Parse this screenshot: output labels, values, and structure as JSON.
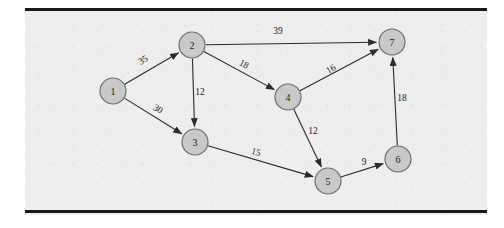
{
  "figure": {
    "background_color": "#eeeeee",
    "rule_color": "#1a1a1a",
    "node_fill": "#c9c9c9",
    "node_stroke": "#6e6e6e",
    "edge_color": "#2b2b2b"
  },
  "chart_data": {
    "type": "diagram",
    "diagram_kind": "directed-weighted-graph",
    "title": "",
    "nodes": [
      {
        "id": "1",
        "label": "1",
        "x": 113,
        "y": 91,
        "r": 13
      },
      {
        "id": "2",
        "label": "2",
        "x": 192,
        "y": 45,
        "r": 13
      },
      {
        "id": "3",
        "label": "3",
        "x": 195,
        "y": 142,
        "r": 13
      },
      {
        "id": "4",
        "label": "4",
        "x": 288,
        "y": 97,
        "r": 13
      },
      {
        "id": "5",
        "label": "5",
        "x": 328,
        "y": 181,
        "r": 13
      },
      {
        "id": "6",
        "label": "6",
        "x": 398,
        "y": 159,
        "r": 13
      },
      {
        "id": "7",
        "label": "7",
        "x": 392,
        "y": 42,
        "r": 13
      }
    ],
    "edges": [
      {
        "from": "1",
        "to": "2",
        "weight": 35,
        "label": "35",
        "label_x": 143,
        "label_y": 60,
        "label_rotate": -30
      },
      {
        "from": "1",
        "to": "3",
        "weight": 30,
        "label": "30",
        "label_x": 158,
        "label_y": 109,
        "label_rotate": 31
      },
      {
        "from": "2",
        "to": "3",
        "weight": 12,
        "label": "12",
        "label_x": 200,
        "label_y": 92,
        "label_rotate": 0
      },
      {
        "from": "2",
        "to": "4",
        "weight": 18,
        "label": "18",
        "label_x": 244,
        "label_y": 64,
        "label_rotate": 28
      },
      {
        "from": "2",
        "to": "7",
        "weight": 39,
        "label": "39",
        "label_x": 278,
        "label_y": 31,
        "label_rotate": 0
      },
      {
        "from": "3",
        "to": "5",
        "weight": 15,
        "label": "15",
        "label_x": 256,
        "label_y": 152,
        "label_rotate": 14
      },
      {
        "from": "4",
        "to": "5",
        "weight": 12,
        "label": "12",
        "label_x": 313,
        "label_y": 131,
        "label_rotate": 0
      },
      {
        "from": "4",
        "to": "7",
        "weight": 16,
        "label": "16",
        "label_x": 331,
        "label_y": 69,
        "label_rotate": -32
      },
      {
        "from": "5",
        "to": "6",
        "weight": 9,
        "label": "9",
        "label_x": 364,
        "label_y": 162,
        "label_rotate": 0
      },
      {
        "from": "6",
        "to": "7",
        "weight": 18,
        "label": "18",
        "label_x": 402,
        "label_y": 98,
        "label_rotate": 0
      }
    ]
  }
}
